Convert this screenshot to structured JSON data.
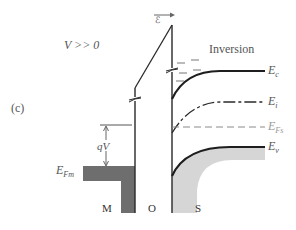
{
  "figure": {
    "panel_label": "(c)",
    "bias_condition": "V >> 0",
    "regime_label": "Inversion",
    "field_symbol": "ℰ",
    "voltage_drop_label": "qV",
    "regions": {
      "metal": "M",
      "oxide": "O",
      "semiconductor": "S"
    },
    "energy_levels": {
      "metal_fermi": {
        "symbol": "E",
        "subscript": "Fm"
      },
      "conduction_band": {
        "symbol": "E",
        "subscript": "c"
      },
      "intrinsic": {
        "symbol": "E",
        "subscript": "i"
      },
      "semiconductor_fermi": {
        "symbol": "E",
        "subscript": "Fs"
      },
      "valence_band": {
        "symbol": "E",
        "subscript": "v"
      }
    },
    "colors": {
      "line": "#2a2a2a",
      "metal_fill": "#6e6e6e",
      "valence_fill": "#d6d6d6",
      "label_text": "#555555",
      "fermi_dashed": "#8a8a8a"
    }
  }
}
